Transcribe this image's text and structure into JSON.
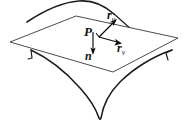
{
  "figure": {
    "background_color": "#ffffff",
    "line_color": "#1c1c1c",
    "plane_fill": "#ffffff",
    "plane_stroke": "#2a2a2a",
    "vector_color": "#0d0d0d",
    "surface_type": "hyperbolic paraboloid (saddle)",
    "labels": {
      "point": "P",
      "tangent_u_base": "r",
      "tangent_u_sub": "u",
      "tangent_v_base": "r",
      "tangent_v_sub": "v",
      "normal": "n"
    },
    "vectors": [
      {
        "name": "r_u",
        "origin": [
          99,
          37
        ],
        "tip": [
          116,
          20
        ],
        "direction": "up-right",
        "label": "r",
        "subscript": "u"
      },
      {
        "name": "r_v",
        "origin": [
          99,
          37
        ],
        "tip": [
          120,
          43
        ],
        "direction": "right-slightly-down",
        "label": "r",
        "subscript": "v"
      },
      {
        "name": "n",
        "origin": [
          93,
          32
        ],
        "tip": [
          93,
          53
        ],
        "direction": "down",
        "label": "n",
        "subscript": ""
      }
    ]
  }
}
